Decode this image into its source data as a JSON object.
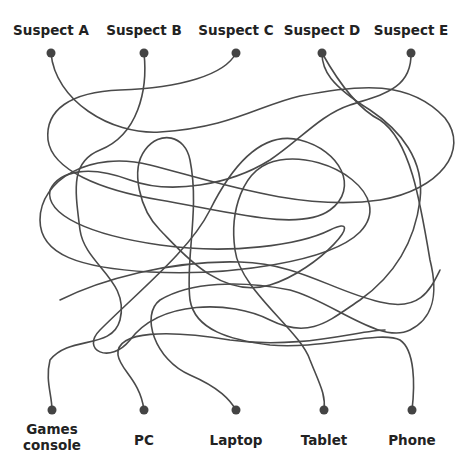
{
  "puzzle": {
    "type": "tangled-lines matching puzzle",
    "suspects": [
      {
        "label": "Suspect A",
        "x": 51
      },
      {
        "label": "Suspect B",
        "x": 144
      },
      {
        "label": "Suspect C",
        "x": 236
      },
      {
        "label": "Suspect D",
        "x": 322
      },
      {
        "label": "Suspect E",
        "x": 411
      }
    ],
    "devices": [
      {
        "label": "Games\nconsole",
        "line1": "Games",
        "line2": "console",
        "x": 52
      },
      {
        "label": "PC",
        "x": 144
      },
      {
        "label": "Laptop",
        "x": 236
      },
      {
        "label": "Tablet",
        "x": 324
      },
      {
        "label": "Phone",
        "x": 412
      }
    ],
    "line_color": "#4a4a4a",
    "dot_color": "#444444"
  }
}
